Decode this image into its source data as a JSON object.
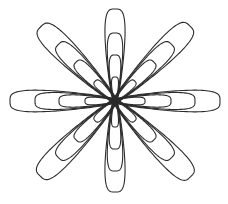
{
  "image": {
    "subject": "flower line drawing",
    "background": "#ffffff",
    "stroke_color": "#2b2b2b",
    "stroke_width": 1.1
  },
  "flower": {
    "center": [
      115,
      101
    ],
    "petals": [
      {
        "name": "petal-north",
        "angle": -90,
        "loops": [
          [
            92,
            13
          ],
          [
            68,
            10
          ],
          [
            46,
            7.5
          ],
          [
            24,
            4.5
          ]
        ]
      },
      {
        "name": "petal-northeast",
        "angle": -45,
        "loops": [
          [
            106,
            15
          ],
          [
            80,
            11.5
          ],
          [
            55,
            8.5
          ],
          [
            28,
            5
          ]
        ]
      },
      {
        "name": "petal-east",
        "angle": 0,
        "loops": [
          [
            105,
            14
          ],
          [
            80,
            11
          ],
          [
            56,
            8
          ],
          [
            30,
            5
          ]
        ]
      },
      {
        "name": "petal-southeast",
        "angle": 45,
        "loops": [
          [
            107,
            15
          ],
          [
            80,
            11.5
          ],
          [
            55,
            8.5
          ],
          [
            28,
            5
          ]
        ]
      },
      {
        "name": "petal-south",
        "angle": 90,
        "loops": [
          [
            91,
            13
          ],
          [
            70,
            10
          ],
          [
            48,
            7.5
          ],
          [
            26,
            4.5
          ]
        ]
      },
      {
        "name": "petal-southwest",
        "angle": 135,
        "loops": [
          [
            106,
            15
          ],
          [
            80,
            11.5
          ],
          [
            55,
            8.5
          ],
          [
            28,
            5
          ]
        ]
      },
      {
        "name": "petal-west",
        "angle": 180,
        "loops": [
          [
            105,
            14
          ],
          [
            80,
            11
          ],
          [
            56,
            8
          ],
          [
            30,
            5
          ]
        ]
      },
      {
        "name": "petal-northwest",
        "angle": -135,
        "loops": [
          [
            105,
            15
          ],
          [
            80,
            11.5
          ],
          [
            55,
            8.5
          ],
          [
            28,
            5
          ]
        ]
      }
    ]
  }
}
